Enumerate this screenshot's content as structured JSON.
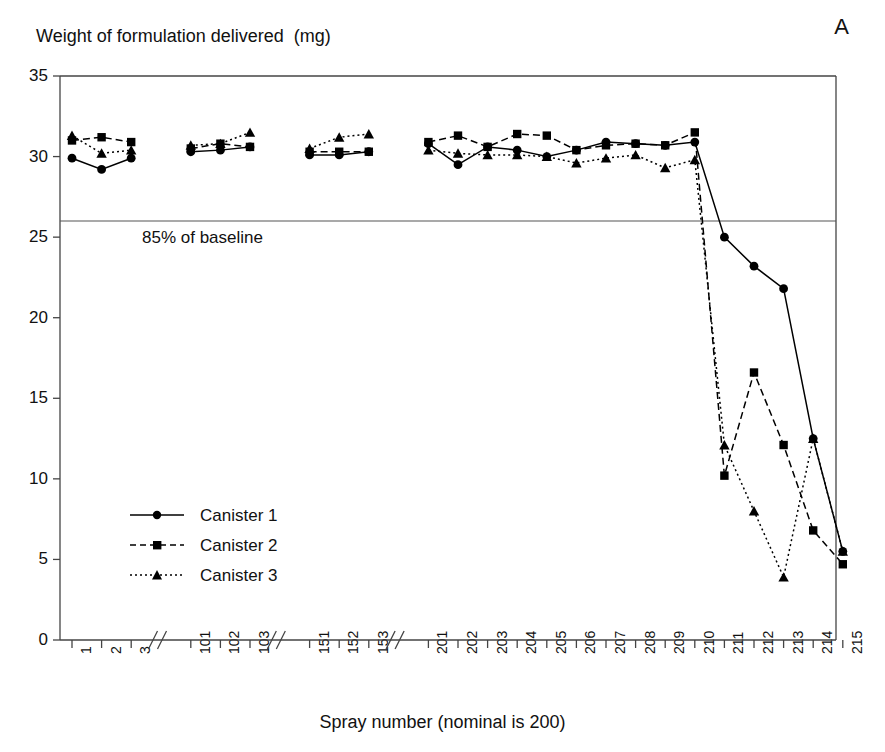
{
  "panel": {
    "label": "A"
  },
  "titles": {
    "y_axis": "Weight of formulation delivered  (mg)",
    "x_axis": "Spray number (nominal is 200)"
  },
  "annotations": {
    "baseline_label": "85% of baseline",
    "baseline_value": 26.0
  },
  "legend": {
    "items": [
      {
        "label": "Canister 1",
        "marker": "circle",
        "dash": "solid"
      },
      {
        "label": "Canister 2",
        "marker": "square",
        "dash": "dashed"
      },
      {
        "label": "Canister 3",
        "marker": "triangle",
        "dash": "dotted"
      }
    ]
  },
  "axes": {
    "y_ticks": [
      "0",
      "5",
      "10",
      "15",
      "20",
      "25",
      "30",
      "35"
    ],
    "y_min": 0,
    "y_max": 35,
    "x_ticks": [
      "1",
      "2",
      "3",
      "101",
      "102",
      "103",
      "151",
      "152",
      "153",
      "201",
      "202",
      "203",
      "204",
      "205",
      "206",
      "207",
      "208",
      "209",
      "210",
      "211",
      "212",
      "213",
      "214",
      "215"
    ],
    "x_breaks_after": [
      "3",
      "103",
      "153"
    ]
  },
  "colors": {
    "line": "#000000",
    "frame": "#444444",
    "baseline": "#555555",
    "background": "#ffffff"
  },
  "chart_data": {
    "type": "line",
    "title": "",
    "xlabel": "Spray number (nominal is 200)",
    "ylabel": "Weight of formulation delivered  (mg)",
    "ylim": [
      0,
      35
    ],
    "grid": false,
    "legend_position": "lower-left",
    "categories": [
      "1",
      "2",
      "3",
      "101",
      "102",
      "103",
      "151",
      "152",
      "153",
      "201",
      "202",
      "203",
      "204",
      "205",
      "206",
      "207",
      "208",
      "209",
      "210",
      "211",
      "212",
      "213",
      "214",
      "215"
    ],
    "series": [
      {
        "name": "Canister 1",
        "marker": "circle",
        "dash": "solid",
        "values": [
          29.9,
          29.2,
          29.9,
          30.3,
          30.4,
          30.6,
          30.1,
          30.1,
          30.3,
          30.8,
          29.5,
          30.6,
          30.4,
          30.0,
          30.4,
          30.9,
          30.8,
          30.7,
          30.9,
          25.0,
          23.2,
          21.8,
          12.5,
          5.5
        ]
      },
      {
        "name": "Canister 2",
        "marker": "square",
        "dash": "dashed",
        "values": [
          31.0,
          31.2,
          30.9,
          30.5,
          30.8,
          30.6,
          30.3,
          30.3,
          30.3,
          30.9,
          31.3,
          30.6,
          31.4,
          31.3,
          30.4,
          30.7,
          30.8,
          30.7,
          31.5,
          10.2,
          16.6,
          12.1,
          6.8,
          4.7
        ]
      },
      {
        "name": "Canister 3",
        "marker": "triangle",
        "dash": "dotted",
        "values": [
          31.3,
          30.2,
          30.4,
          30.7,
          30.8,
          31.5,
          30.5,
          31.2,
          31.4,
          30.4,
          30.2,
          30.1,
          30.1,
          30.0,
          29.6,
          29.9,
          30.1,
          29.3,
          29.8,
          12.1,
          8.0,
          3.9,
          12.5,
          5.5
        ]
      }
    ]
  }
}
